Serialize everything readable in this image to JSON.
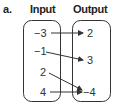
{
  "diagram": {
    "part_label": "a.",
    "input_title": "Input",
    "output_title": "Output",
    "inputs": [
      "−3",
      "−1",
      "2",
      "4"
    ],
    "outputs": [
      "2",
      "3",
      "−4"
    ],
    "mappings": [
      {
        "from": "−3",
        "to": "2"
      },
      {
        "from": "−1",
        "to": "3"
      },
      {
        "from": "2",
        "to": "−4"
      },
      {
        "from": "4",
        "to": "−4"
      }
    ]
  }
}
